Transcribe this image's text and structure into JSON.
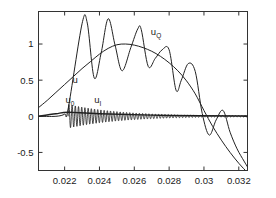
{
  "chart_data": {
    "type": "line",
    "title": "",
    "xlabel": "",
    "ylabel": "",
    "xlim": [
      0.0205,
      0.0325
    ],
    "ylim": [
      -0.75,
      1.45
    ],
    "xticks": [
      0.022,
      0.024,
      0.026,
      0.028,
      0.03,
      0.032
    ],
    "xtick_labels": [
      "0.022",
      "0.024",
      "0.026",
      "0.028",
      "0.03",
      "0.032"
    ],
    "yticks": [
      -0.5,
      0,
      0.5,
      1
    ],
    "ytick_labels": [
      "-0.5",
      "0",
      "0.5",
      "1"
    ],
    "grid": false,
    "legend": "inline-annotations",
    "line_color": "#222222",
    "axis_color": "#333333",
    "background": "#ffffff",
    "annotations": [
      {
        "name": "u",
        "base": "u",
        "sub": "",
        "x": 0.02245,
        "y": 0.46
      },
      {
        "name": "u_Q",
        "base": "u",
        "sub": "Q",
        "x": 0.02695,
        "y": 1.12
      },
      {
        "name": "u_0",
        "base": "u",
        "sub": "0",
        "x": 0.02205,
        "y": 0.18
      },
      {
        "name": "u_I",
        "base": "u",
        "sub": "I",
        "x": 0.0237,
        "y": 0.185
      }
    ],
    "series": [
      {
        "name": "u",
        "description": "smooth envelope, rises from 0.12 to peak 1.0 near x=0.0255 then falls below zero after x=0.0300",
        "x": [
          0.0205,
          0.021,
          0.0215,
          0.022,
          0.0225,
          0.023,
          0.0235,
          0.024,
          0.0245,
          0.025,
          0.0255,
          0.026,
          0.0265,
          0.027,
          0.0275,
          0.028,
          0.0285,
          0.029,
          0.0295,
          0.03,
          0.0305,
          0.031,
          0.0315,
          0.032,
          0.0325
        ],
        "y": [
          0.12,
          0.22,
          0.33,
          0.44,
          0.55,
          0.66,
          0.76,
          0.86,
          0.94,
          0.99,
          1.0,
          0.985,
          0.95,
          0.9,
          0.83,
          0.74,
          0.63,
          0.49,
          0.31,
          0.08,
          -0.14,
          -0.33,
          -0.5,
          -0.65,
          -0.78
        ]
      },
      {
        "name": "u_Q",
        "description": "oscillating carrier modulated by envelope; peaks 1.29, 1.35, 1.21, 0.92, 0.47 and troughs 0.53, 0.63, 0.69, 0.36, -0.26",
        "x": [
          0.0205,
          0.0215,
          0.022,
          0.0222,
          0.023,
          0.0233,
          0.0237,
          0.0241,
          0.0245,
          0.0249,
          0.0253,
          0.0258,
          0.0262,
          0.0264,
          0.0268,
          0.0272,
          0.0276,
          0.028,
          0.0284,
          0.0287,
          0.0291,
          0.0295,
          0.0299,
          0.0303,
          0.0307,
          0.0311,
          0.0315,
          0.0319,
          0.0323,
          0.0325
        ],
        "y": [
          0.0,
          0.0,
          0.03,
          0.1,
          1.28,
          1.29,
          0.53,
          0.88,
          1.35,
          0.98,
          0.63,
          0.95,
          1.21,
          1.2,
          0.69,
          0.8,
          0.92,
          0.92,
          0.36,
          0.5,
          0.73,
          0.62,
          0.04,
          -0.26,
          -0.05,
          0.08,
          -0.22,
          -0.45,
          -0.62,
          -0.7
        ]
      },
      {
        "name": "u_0",
        "description": "slow near-zero ramp rising slightly from origin then flat along zero axis",
        "x": [
          0.0205,
          0.0215,
          0.0222,
          0.024,
          0.028,
          0.0325
        ],
        "y": [
          0.0,
          0.035,
          0.055,
          0.035,
          0.012,
          0.004
        ]
      },
      {
        "name": "u_I",
        "description": "high-frequency oscillation starting at x=0.0222 with amplitude 0.16 decaying to near 0.01 by x=0.0300, then flat",
        "x_start": 0.0222,
        "x_end": 0.0325,
        "amplitude_start": 0.165,
        "amplitude_end": 0.012,
        "cycles": 56
      }
    ]
  }
}
